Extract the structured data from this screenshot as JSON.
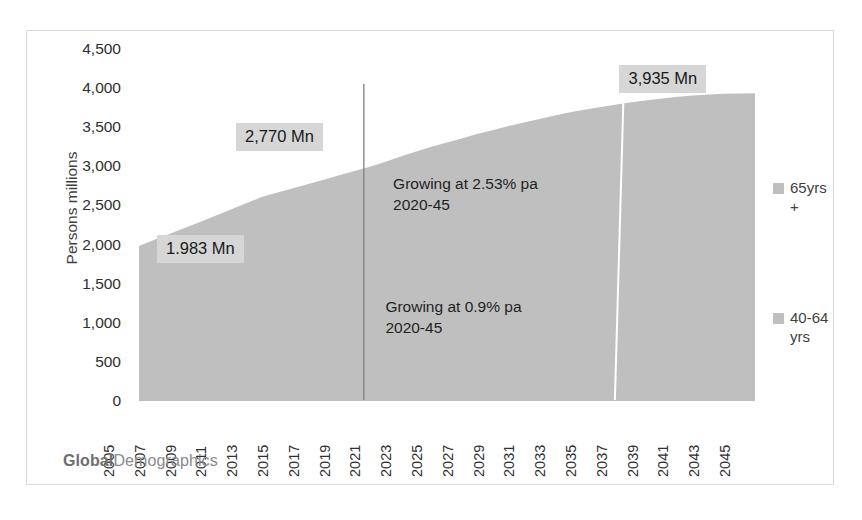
{
  "branding": {
    "bold_part": "Global",
    "light_part": "Demographics"
  },
  "legend": {
    "swatch_color": "#bfbfbf",
    "items": [
      {
        "label": "65yrs +",
        "name": "legend-65-plus"
      },
      {
        "label": "40-64 yrs",
        "name": "legend-40-64"
      }
    ]
  },
  "callouts": [
    {
      "text": "1.983 Mn",
      "year": 2005,
      "value": 1983
    },
    {
      "text": "2,770 Mn",
      "year": 2013,
      "value": 2770
    },
    {
      "text": "3,935 Mn",
      "year": 2045,
      "value": 3935
    }
  ],
  "annotations": [
    {
      "line1": "Growing at 2.53% pa",
      "line2": "2020-45"
    },
    {
      "line1": "Growing at 0.9% pa",
      "line2": "2020-45"
    }
  ],
  "chart_data": {
    "type": "area",
    "title": "",
    "xlabel": "",
    "ylabel": "Persons millions",
    "ylim": [
      0,
      4500
    ],
    "ytick_step": 500,
    "ytick_labels": [
      "4,500",
      "4,000",
      "3,500",
      "3,000",
      "2,500",
      "2,000",
      "1,500",
      "1,000",
      "500",
      "0"
    ],
    "ytick_values": [
      4500,
      4000,
      3500,
      3000,
      2500,
      2000,
      1500,
      1000,
      500,
      0
    ],
    "grid": false,
    "legend_position": "right",
    "xlim": [
      2005,
      2045
    ],
    "xtick_labels": [
      "2005",
      "2007",
      "2009",
      "2011",
      "2013",
      "2015",
      "2017",
      "2019",
      "2021",
      "2023",
      "2025",
      "2027",
      "2029",
      "2031",
      "2033",
      "2035",
      "2037",
      "2039",
      "2041",
      "2043",
      "2045"
    ],
    "x": [
      2005,
      2006,
      2007,
      2008,
      2009,
      2010,
      2011,
      2012,
      2013,
      2014,
      2015,
      2016,
      2017,
      2018,
      2019,
      2020,
      2021,
      2022,
      2023,
      2024,
      2025,
      2026,
      2027,
      2028,
      2029,
      2030,
      2031,
      2032,
      2033,
      2034,
      2035,
      2036,
      2037,
      2038,
      2039,
      2040,
      2041,
      2042,
      2043,
      2044,
      2045
    ],
    "series": [
      {
        "name": "Total 40yrs +",
        "color": "#bfbfbf",
        "values": [
          1983,
          2060,
          2137,
          2215,
          2292,
          2370,
          2450,
          2530,
          2610,
          2665,
          2720,
          2775,
          2830,
          2885,
          2940,
          2995,
          3060,
          3125,
          3190,
          3250,
          3305,
          3360,
          3415,
          3465,
          3515,
          3560,
          3605,
          3650,
          3690,
          3725,
          3760,
          3790,
          3818,
          3845,
          3868,
          3888,
          3905,
          3918,
          3928,
          3932,
          3935
        ]
      }
    ],
    "markers": [
      {
        "type": "vertical-line",
        "year": 2019.6,
        "color": "#808080",
        "top_value": 4055,
        "bottom_value": 0
      },
      {
        "type": "vertical-line-split",
        "year": 2036,
        "color": "#ffffff",
        "top_value": 3820,
        "bottom_value": 0
      }
    ]
  }
}
